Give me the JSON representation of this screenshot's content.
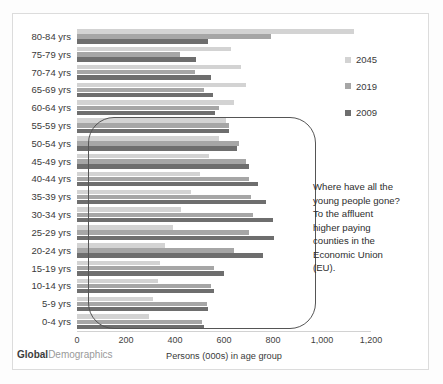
{
  "chart_data": {
    "type": "bar",
    "orientation": "horizontal",
    "title": "",
    "xlabel": "Persons (000s) in age group",
    "ylabel": "",
    "xlim": [
      0,
      1200
    ],
    "xticks": [
      0,
      200,
      400,
      600,
      800,
      1000,
      1200
    ],
    "xticklabels": [
      "0",
      "200",
      "400",
      "600",
      "800",
      "1,000",
      "1,200"
    ],
    "grid": false,
    "legend_position": "right",
    "categories": [
      "80-84 yrs",
      "75-79 yrs",
      "70-74 yrs",
      "65-69 yrs",
      "60-64 yrs",
      "55-59 yrs",
      "50-54 yrs",
      "45-49 yrs",
      "40-44 yrs",
      "35-39 yrs",
      "30-34 yrs",
      "25-29 yrs",
      "20-24 yrs",
      "15-19 yrs",
      "10-14 yrs",
      "5-9 yrs",
      "0-4 yrs"
    ],
    "series": [
      {
        "name": "2045",
        "color": "#d3d3d3",
        "values": [
          1130,
          630,
          670,
          690,
          640,
          610,
          580,
          540,
          500,
          465,
          425,
          390,
          360,
          340,
          330,
          310,
          295
        ]
      },
      {
        "name": "2019",
        "color": "#a6a6a6",
        "values": [
          790,
          420,
          480,
          520,
          580,
          620,
          660,
          690,
          700,
          710,
          720,
          700,
          640,
          560,
          545,
          530,
          510
        ]
      },
      {
        "name": "2009",
        "color": "#6e6e6e",
        "values": [
          535,
          485,
          545,
          555,
          565,
          620,
          655,
          700,
          740,
          770,
          800,
          805,
          760,
          600,
          560,
          535,
          520
        ]
      }
    ],
    "annotation": "Where have all the\nyoung people gone?\nTo the affluent\nhigher paying\ncounties in the\nEconomic Union\n(EU)."
  },
  "footer": {
    "brand_bold": "Global",
    "brand_light": "Demographics"
  }
}
